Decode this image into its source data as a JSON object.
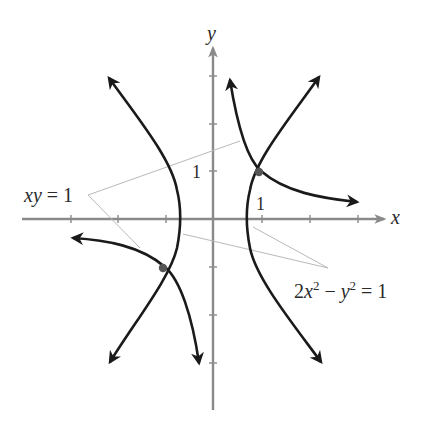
{
  "figure": {
    "type": "graph-of-two-hyperbolas",
    "axes": {
      "x_label": "x",
      "y_label": "y",
      "x_tick_label": "1",
      "y_tick_label": "1",
      "x_ticks": [
        -3,
        -2,
        -1,
        1,
        2,
        3
      ],
      "y_ticks": [
        -3,
        -2,
        -1,
        1,
        2,
        3
      ]
    },
    "curves": [
      {
        "name": "xy = 1",
        "label": "xy = 1"
      },
      {
        "name": "2x^2 - y^2 = 1",
        "label_parts": [
          "2x",
          "2",
          " − y",
          "2",
          " = 1"
        ]
      }
    ],
    "intersection_points": [
      {
        "x": 1,
        "y": 1
      },
      {
        "x": -1,
        "y": -1
      }
    ],
    "colors": {
      "curve": "#1a1a1a",
      "axis": "#8a8a8a",
      "leader": "#b9b9b9",
      "point": "#555555"
    }
  }
}
